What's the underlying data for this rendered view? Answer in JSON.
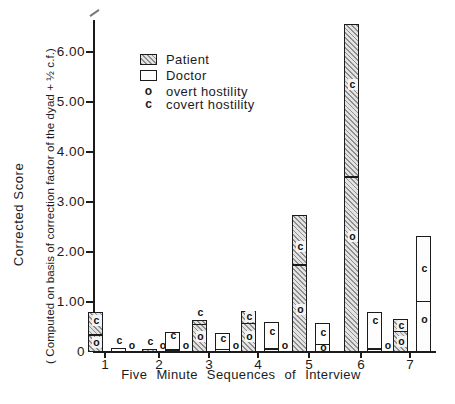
{
  "y_axis": {
    "title": "Corrected Score",
    "subtitle": "( Computed on basis of correction factor of the dyad + ½ c.f.)",
    "ticks": [
      {
        "label": "6.00",
        "value": 6
      },
      {
        "label": "5.00",
        "value": 5
      },
      {
        "label": "4.00",
        "value": 4
      },
      {
        "label": "3.00",
        "value": 3
      },
      {
        "label": "2.00",
        "value": 2
      },
      {
        "label": "1.00",
        "value": 1
      },
      {
        "label": "0",
        "value": 0
      }
    ]
  },
  "x_axis": {
    "title": "Five Minute Sequences of Interview",
    "ticks": [
      "1",
      "2",
      "3",
      "4",
      "5",
      "6",
      "7"
    ]
  },
  "legend": {
    "items": [
      {
        "swatch": "hatched",
        "label": "Patient"
      },
      {
        "swatch": "open",
        "label": "Doctor"
      },
      {
        "symbol": "o",
        "label": "overt hostility"
      },
      {
        "symbol": "c",
        "label": "covert hostility"
      }
    ]
  },
  "chart_data": {
    "type": "bar",
    "title": "",
    "xlabel": "Five Minute Sequences of Interview",
    "ylabel": "Corrected Score ( Computed on basis of correction factor of the dyad + ½ c.f.)",
    "categories": [
      1,
      2,
      3,
      4,
      5,
      6,
      7
    ],
    "ylim": [
      0,
      6.6
    ],
    "ytick_values": [
      0,
      1,
      2,
      3,
      4,
      5,
      6
    ],
    "grid": false,
    "legend_position": "upper-left-inside",
    "annotation_codes": {
      "o": "overt hostility",
      "c": "covert hostility"
    },
    "series": [
      {
        "name": "Patient",
        "style": "hatched",
        "totals": [
          0.8,
          0.05,
          0.64,
          0.82,
          2.73,
          6.55,
          0.66
        ],
        "overt": [
          0.34,
          0.0,
          0.55,
          0.57,
          1.74,
          3.5,
          0.41
        ],
        "covert": [
          0.46,
          0.05,
          0.09,
          0.25,
          0.99,
          3.05,
          0.25
        ]
      },
      {
        "name": "Doctor",
        "style": "open",
        "totals": [
          0.08,
          0.4,
          0.37,
          0.59,
          0.58,
          0.79,
          2.31
        ],
        "overt": [
          0.0,
          0.04,
          0.05,
          0.06,
          0.15,
          0.06,
          1.01
        ],
        "covert": [
          0.08,
          0.36,
          0.32,
          0.53,
          0.43,
          0.73,
          1.3
        ]
      }
    ],
    "bars": [
      {
        "seq": 1,
        "group": "Patient",
        "total": 0.8,
        "overt": 0.34,
        "c_label": {
          "pos": "inside",
          "y": 0.63
        },
        "o_label": {
          "pos": "inside",
          "y": 0.19
        }
      },
      {
        "seq": 1,
        "group": "Doctor",
        "total": 0.08,
        "overt": 0.0,
        "c_label": {
          "pos": "above"
        },
        "o_label": {
          "pos": "outside"
        }
      },
      {
        "seq": 2,
        "group": "Patient",
        "total": 0.05,
        "overt": 0.0,
        "c_label": {
          "pos": "above"
        },
        "o_label": {
          "pos": "outside"
        }
      },
      {
        "seq": 2,
        "group": "Doctor",
        "total": 0.4,
        "overt": 0.04,
        "c_label": {
          "pos": "inside",
          "y": 0.33
        },
        "o_label": {
          "pos": "outside"
        }
      },
      {
        "seq": 3,
        "group": "Patient",
        "total": 0.64,
        "overt": 0.55,
        "c_label": {
          "pos": "above"
        },
        "o_label": {
          "pos": "inside",
          "y": 0.3
        }
      },
      {
        "seq": 3,
        "group": "Doctor",
        "total": 0.37,
        "overt": 0.05,
        "c_label": {
          "pos": "inside",
          "y": 0.27
        },
        "o_label": {
          "pos": "outside"
        }
      },
      {
        "seq": 4,
        "group": "Patient",
        "total": 0.82,
        "overt": 0.57,
        "c_label": {
          "pos": "inside",
          "y": 0.7
        },
        "o_label": {
          "pos": "inside",
          "y": 0.3
        }
      },
      {
        "seq": 4,
        "group": "Doctor",
        "total": 0.59,
        "overt": 0.06,
        "c_label": {
          "pos": "inside",
          "y": 0.4
        },
        "o_label": {
          "pos": "outside"
        }
      },
      {
        "seq": 5,
        "group": "Patient",
        "total": 2.73,
        "overt": 1.74,
        "c_label": {
          "pos": "inside",
          "y": 2.1
        },
        "o_label": {
          "pos": "inside",
          "y": 0.84
        }
      },
      {
        "seq": 5,
        "group": "Doctor",
        "total": 0.58,
        "overt": 0.15,
        "c_label": {
          "pos": "inside",
          "y": 0.39
        },
        "o_label": {
          "pos": "inside",
          "y": 0.08
        }
      },
      {
        "seq": 6,
        "group": "Patient",
        "total": 6.55,
        "overt": 3.5,
        "c_label": {
          "pos": "inside",
          "y": 5.35
        },
        "o_label": {
          "pos": "inside",
          "y": 2.3
        }
      },
      {
        "seq": 6,
        "group": "Doctor",
        "total": 0.79,
        "overt": 0.06,
        "c_label": {
          "pos": "inside",
          "y": 0.62
        },
        "o_label": {
          "pos": "outside"
        }
      },
      {
        "seq": 7,
        "group": "Patient",
        "total": 0.66,
        "overt": 0.41,
        "c_label": {
          "pos": "inside",
          "y": 0.53
        },
        "o_label": {
          "pos": "inside",
          "y": 0.2
        }
      },
      {
        "seq": 7,
        "group": "Doctor",
        "total": 2.31,
        "overt": 1.01,
        "c_label": {
          "pos": "inside",
          "y": 1.67
        },
        "o_label": {
          "pos": "inside",
          "y": 0.64
        }
      }
    ]
  }
}
